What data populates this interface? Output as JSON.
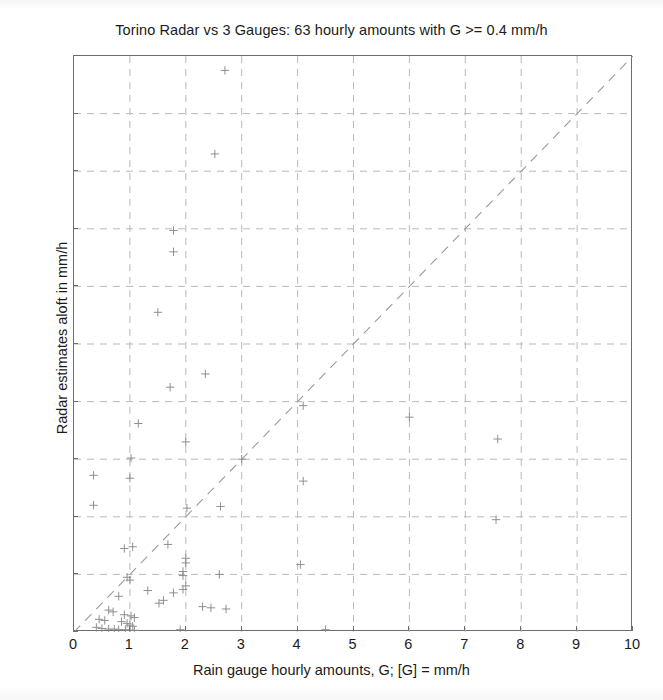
{
  "chart_data": {
    "type": "scatter",
    "title": "Torino Radar vs 3 Gauges: 63 hourly amounts with G >= 0.4 mm/h",
    "xlabel": "Rain gauge hourly amounts, G; [G] = mm/h",
    "ylabel": "Radar estimates aloft in mm/h",
    "xlim": [
      0,
      10
    ],
    "ylim": [
      0,
      10
    ],
    "xticks": [
      0,
      1,
      2,
      3,
      4,
      5,
      6,
      7,
      8,
      9,
      10
    ],
    "yticks": [
      0,
      1,
      2,
      3,
      4,
      5,
      6,
      7,
      8,
      9,
      10
    ],
    "grid": true,
    "grid_style": "dashed",
    "legend": "none",
    "marker": "plus",
    "marker_color": "#8a8a8a",
    "reference_line": {
      "label": "1:1 line",
      "style": "dashed",
      "from": [
        0,
        0
      ],
      "to": [
        10,
        10
      ],
      "color": "#9a9a9a"
    },
    "n_points": 63,
    "points": [
      [
        2.7,
        9.75
      ],
      [
        2.52,
        8.3
      ],
      [
        1.78,
        6.97
      ],
      [
        1.78,
        6.6
      ],
      [
        1.5,
        5.55
      ],
      [
        2.35,
        4.48
      ],
      [
        1.72,
        4.25
      ],
      [
        4.1,
        3.93
      ],
      [
        6.0,
        3.73
      ],
      [
        1.15,
        3.62
      ],
      [
        7.58,
        3.35
      ],
      [
        2.0,
        3.3
      ],
      [
        1.02,
        3.02
      ],
      [
        3.0,
        3.0
      ],
      [
        0.35,
        2.72
      ],
      [
        1.0,
        2.67
      ],
      [
        4.1,
        2.62
      ],
      [
        0.35,
        2.2
      ],
      [
        2.62,
        2.18
      ],
      [
        2.02,
        2.15
      ],
      [
        7.55,
        1.95
      ],
      [
        1.68,
        1.52
      ],
      [
        1.05,
        1.48
      ],
      [
        0.9,
        1.45
      ],
      [
        2.0,
        1.28
      ],
      [
        2.0,
        1.2
      ],
      [
        4.05,
        1.17
      ],
      [
        1.95,
        1.05
      ],
      [
        1.95,
        0.98
      ],
      [
        2.6,
        1.0
      ],
      [
        0.95,
        0.95
      ],
      [
        1.0,
        0.9
      ],
      [
        2.0,
        0.8
      ],
      [
        1.95,
        0.74
      ],
      [
        1.32,
        0.72
      ],
      [
        1.78,
        0.68
      ],
      [
        0.8,
        0.62
      ],
      [
        1.6,
        0.55
      ],
      [
        1.52,
        0.5
      ],
      [
        2.3,
        0.44
      ],
      [
        2.45,
        0.42
      ],
      [
        2.72,
        0.4
      ],
      [
        0.62,
        0.38
      ],
      [
        0.7,
        0.35
      ],
      [
        0.9,
        0.3
      ],
      [
        1.02,
        0.28
      ],
      [
        1.08,
        0.25
      ],
      [
        0.45,
        0.22
      ],
      [
        0.55,
        0.2
      ],
      [
        0.85,
        0.18
      ],
      [
        0.95,
        0.15
      ],
      [
        1.0,
        0.12
      ],
      [
        1.05,
        0.1
      ],
      [
        0.4,
        0.08
      ],
      [
        0.5,
        0.06
      ],
      [
        0.62,
        0.05
      ],
      [
        0.72,
        0.05
      ],
      [
        0.8,
        0.04
      ],
      [
        0.92,
        0.04
      ],
      [
        1.0,
        0.03
      ],
      [
        1.08,
        0.03
      ],
      [
        1.9,
        0.04
      ],
      [
        4.5,
        0.04
      ]
    ]
  },
  "axis": {
    "x_tick_labels": [
      "0",
      "1",
      "2",
      "3",
      "4",
      "5",
      "6",
      "7",
      "8",
      "9",
      "10"
    ],
    "y_tick_labels": [
      "0",
      "1",
      "2",
      "3",
      "4",
      "5",
      "6",
      "7",
      "8",
      "9",
      "10"
    ]
  }
}
